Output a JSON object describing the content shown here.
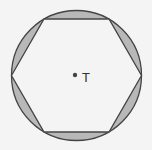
{
  "diagram": {
    "shape": "regular hexagon inscribed in circle",
    "center_label": "T",
    "colors": {
      "background": "#f4f4f4",
      "shaded_segments": "#b8b8b8",
      "stroke": "#444444",
      "hexagon_fill": "#f4f4f4"
    }
  }
}
